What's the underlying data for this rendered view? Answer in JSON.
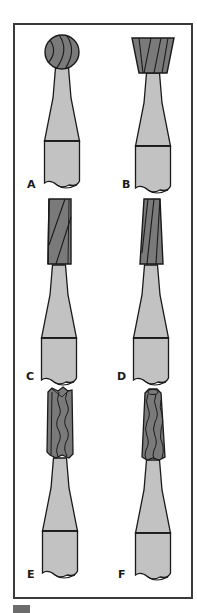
{
  "figure": {
    "panels": [
      {
        "label": "A",
        "head": "round",
        "description": "Round bur"
      },
      {
        "label": "B",
        "head": "inverted-cone",
        "description": "Inverted cone bur"
      },
      {
        "label": "C",
        "head": "straight-fissure",
        "description": "Straight fissure bur"
      },
      {
        "label": "D",
        "head": "tapered-fissure",
        "description": "Tapered fissure bur"
      },
      {
        "label": "E",
        "head": "straight-fissure-crosscut",
        "description": "Crosscut straight fissure bur"
      },
      {
        "label": "F",
        "head": "tapered-fissure-crosscut",
        "description": "Crosscut tapered fissure bur"
      }
    ],
    "colors": {
      "head_fill": "#7a7a7a",
      "shank_fill": "#c2c2c2",
      "outline": "#1a1a1a",
      "frame": "#3a3a3a",
      "marker": "#6b6b6b"
    }
  }
}
